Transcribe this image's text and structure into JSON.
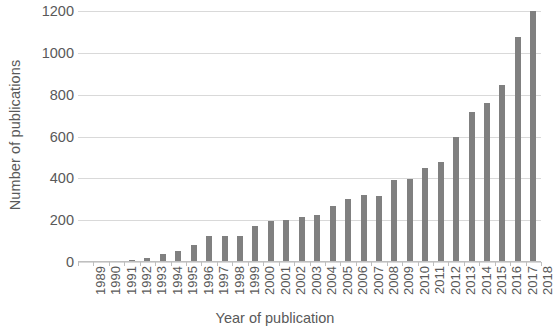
{
  "chart_data": {
    "type": "bar",
    "title": "",
    "xlabel": "Year of publication",
    "ylabel": "Number of publications",
    "categories": [
      "1989",
      "1990",
      "1991",
      "1992",
      "1993",
      "1994",
      "1995",
      "1996",
      "1997",
      "1998",
      "1999",
      "2000",
      "2001",
      "2002",
      "2003",
      "2004",
      "2005",
      "2006",
      "2007",
      "2008",
      "2009",
      "2010",
      "2011",
      "2012",
      "2013",
      "2014",
      "2015",
      "2016",
      "2017",
      "2018"
    ],
    "values": [
      2,
      3,
      6,
      10,
      18,
      38,
      55,
      83,
      122,
      125,
      122,
      170,
      196,
      200,
      213,
      226,
      268,
      299,
      320,
      318,
      392,
      398,
      448,
      478,
      600,
      719,
      762,
      848,
      1078,
      1200
    ],
    "ylim": [
      0,
      1200
    ],
    "ytick_values": [
      0,
      200,
      400,
      600,
      800,
      1000,
      1200
    ],
    "ytick_labels": [
      "0",
      "200",
      "400",
      "600",
      "800",
      "1000",
      "1200"
    ],
    "grid": true,
    "legend": false,
    "bar_color": "#808080",
    "gridline_color": "#d9d9d9",
    "text_color": "#595959",
    "background_color": "#ffffff"
  }
}
